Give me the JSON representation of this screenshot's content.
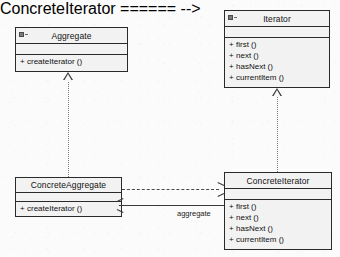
{
  "diagram": {
    "classes": [
      {
        "id": "aggregate",
        "name": "Aggregate",
        "icon": "interface-icon",
        "attributes": [],
        "operations": [
          {
            "visibility": "+",
            "signature": "createIterator ()"
          }
        ]
      },
      {
        "id": "iterator",
        "name": "Iterator",
        "icon": "interface-icon",
        "attributes": [],
        "operations": [
          {
            "visibility": "+",
            "signature": "first ()"
          },
          {
            "visibility": "+",
            "signature": "next ()"
          },
          {
            "visibility": "+",
            "signature": "hasNext ()"
          },
          {
            "visibility": "+",
            "signature": "currentItem ()"
          }
        ]
      },
      {
        "id": "concrete-aggregate",
        "name": "ConcreteAggregate",
        "icon": "",
        "attributes": [],
        "operations": [
          {
            "visibility": "+",
            "signature": "createIterator ()"
          }
        ]
      },
      {
        "id": "concrete-iterator",
        "name": "ConcreteIterator",
        "icon": "",
        "attributes": [],
        "operations": [
          {
            "visibility": "+",
            "signature": "first ()"
          },
          {
            "visibility": "+",
            "signature": "next ()"
          },
          {
            "visibility": "+",
            "signature": "hasNext ()"
          },
          {
            "visibility": "+",
            "signature": "currentItem ()"
          }
        ]
      }
    ],
    "relations": [
      {
        "id": "realize-aggregate",
        "type": "realization",
        "from": "ConcreteAggregate",
        "to": "Aggregate",
        "label": ""
      },
      {
        "id": "realize-iterator",
        "type": "realization",
        "from": "ConcreteIterator",
        "to": "Iterator",
        "label": ""
      },
      {
        "id": "dependency-createiterator",
        "type": "dependency",
        "from": "ConcreteAggregate",
        "to": "ConcreteIterator",
        "label": ""
      },
      {
        "id": "association-aggregate",
        "type": "association",
        "from": "ConcreteIterator",
        "to": "ConcreteAggregate",
        "label": "aggregate"
      }
    ],
    "colors": {
      "background": "#fbfbfb",
      "box_fill": "#f2f2f2",
      "box_border": "#2a2a2a",
      "line": "#3a3a3a",
      "dotted_line": "#7c7c7c",
      "text": "#111111"
    }
  }
}
